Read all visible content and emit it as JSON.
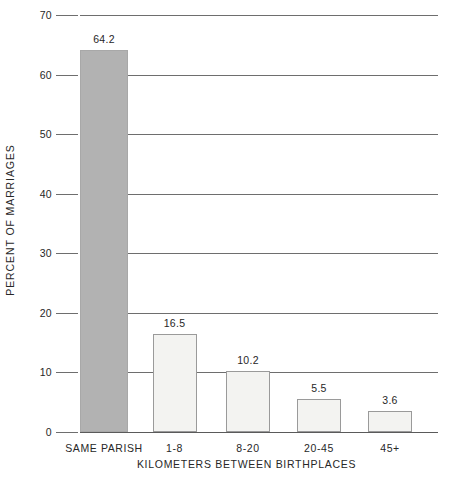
{
  "chart_data": {
    "type": "bar",
    "title": "",
    "xlabel": "KILOMETERS BETWEEN BIRTHPLACES",
    "ylabel": "PERCENT OF MARRIAGES",
    "categories": [
      "SAME PARISH",
      "1-8",
      "8-20",
      "20-45",
      "45+"
    ],
    "values": [
      64.2,
      16.5,
      10.2,
      5.5,
      3.6
    ],
    "value_labels": [
      "64.2",
      "16.5",
      "10.2",
      "5.5",
      "3.6"
    ],
    "ylim": [
      0,
      70
    ],
    "ytick_labels": [
      "0",
      "10",
      "20",
      "30",
      "40",
      "50",
      "60",
      "70"
    ],
    "ytick_values": [
      0,
      10,
      20,
      30,
      40,
      50,
      60,
      70
    ],
    "grid": "horizontal",
    "legend": "none",
    "bar_styles": [
      "shaded",
      "open",
      "open",
      "open",
      "open"
    ],
    "colors": {
      "shaded_fill": "#b2b2b2",
      "open_fill": "#f3f3f1",
      "bar_border": "#9a9a9a",
      "gridline": "#6e6e6e",
      "text": "#272727",
      "background": "#ffffff"
    }
  }
}
